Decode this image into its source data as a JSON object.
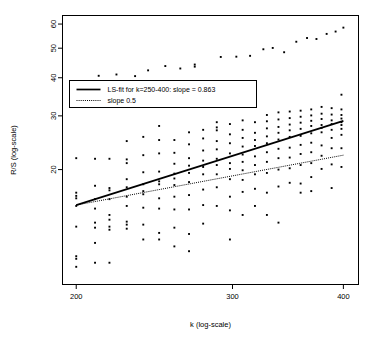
{
  "chart_data": {
    "type": "scatter",
    "title": "",
    "xlabel": "k (log-scale)",
    "ylabel": "R/S (log-scale)",
    "xscale": "log",
    "yscale": "log",
    "xlim": [
      193,
      416
    ],
    "ylim": [
      8.4,
      64
    ],
    "grid": false,
    "xticks": [
      200,
      300,
      400
    ],
    "xtick_labels": [
      "200",
      "300",
      "400"
    ],
    "yticks": [
      20,
      30,
      40,
      50,
      60
    ],
    "ytick_labels": [
      "20",
      "30",
      "40",
      "50",
      "60"
    ],
    "legend": {
      "position": "upper-left",
      "entries": [
        {
          "label": "LS-fit for k=250-400: slope = 0.863",
          "style": "solid"
        },
        {
          "label": "slope 0.5",
          "style": "dotted"
        }
      ]
    },
    "series": [
      {
        "name": "LS-fit for k=250-400: slope = 0.863",
        "type": "line",
        "style": "solid",
        "slope": 0.863,
        "x": [
          200,
          400
        ],
        "y": [
          15.3,
          28.9
        ]
      },
      {
        "name": "slope 0.5",
        "type": "line",
        "style": "dotted",
        "slope": 0.5,
        "x": [
          200,
          400
        ],
        "y": [
          15.3,
          22.3
        ]
      },
      {
        "name": "R/S values",
        "type": "scatter",
        "marker": "filled-square",
        "points": [
          [
            200,
            21.8
          ],
          [
            200,
            16.8
          ],
          [
            200,
            16.4
          ],
          [
            200,
            16.1
          ],
          [
            200,
            15.2
          ],
          [
            200,
            13.0
          ],
          [
            200,
            10.4
          ],
          [
            200,
            10.2
          ],
          [
            200,
            9.6
          ],
          [
            207,
            37.3
          ],
          [
            210,
            21.7
          ],
          [
            210,
            17.7
          ],
          [
            210,
            16.0
          ],
          [
            210,
            14.9
          ],
          [
            210,
            13.4
          ],
          [
            210,
            12.9
          ],
          [
            210,
            11.5
          ],
          [
            210,
            9.9
          ],
          [
            212,
            40.6
          ],
          [
            218,
            21.7
          ],
          [
            218,
            17.4
          ],
          [
            218,
            17.1
          ],
          [
            218,
            16.0
          ],
          [
            218,
            14.2
          ],
          [
            218,
            13.7
          ],
          [
            218,
            13.0
          ],
          [
            218,
            12.7
          ],
          [
            218,
            9.9
          ],
          [
            222,
            41.0
          ],
          [
            228,
            24.8
          ],
          [
            228,
            21.6
          ],
          [
            228,
            21.0
          ],
          [
            228,
            18.6
          ],
          [
            228,
            17.5
          ],
          [
            228,
            16.3
          ],
          [
            228,
            15.2
          ],
          [
            228,
            13.5
          ],
          [
            228,
            13.2
          ],
          [
            228,
            12.8
          ],
          [
            233,
            40.5
          ],
          [
            238,
            25.6
          ],
          [
            238,
            22.3
          ],
          [
            238,
            19.6
          ],
          [
            238,
            17.9
          ],
          [
            238,
            17.0
          ],
          [
            238,
            16.6
          ],
          [
            238,
            15.0
          ],
          [
            238,
            13.2
          ],
          [
            238,
            11.8
          ],
          [
            241,
            42.3
          ],
          [
            248,
            27.8
          ],
          [
            248,
            25.0
          ],
          [
            248,
            22.6
          ],
          [
            248,
            19.7
          ],
          [
            248,
            18.3
          ],
          [
            248,
            17.9
          ],
          [
            248,
            16.1
          ],
          [
            248,
            14.9
          ],
          [
            248,
            12.4
          ],
          [
            248,
            11.8
          ],
          [
            252,
            43.7
          ],
          [
            258,
            25.0
          ],
          [
            258,
            22.7
          ],
          [
            258,
            20.9
          ],
          [
            258,
            19.4
          ],
          [
            258,
            18.7
          ],
          [
            258,
            17.8
          ],
          [
            258,
            16.3
          ],
          [
            258,
            14.8
          ],
          [
            258,
            12.9
          ],
          [
            258,
            11.2
          ],
          [
            262,
            42.9
          ],
          [
            268,
            26.5
          ],
          [
            268,
            24.2
          ],
          [
            268,
            21.8
          ],
          [
            268,
            20.6
          ],
          [
            268,
            19.5
          ],
          [
            268,
            18.2
          ],
          [
            268,
            16.5
          ],
          [
            268,
            14.8
          ],
          [
            268,
            12.3
          ],
          [
            268,
            10.8
          ],
          [
            272,
            44.2
          ],
          [
            272,
            43.5
          ],
          [
            278,
            27.0
          ],
          [
            278,
            25.3
          ],
          [
            278,
            23.1
          ],
          [
            278,
            21.4
          ],
          [
            278,
            20.4
          ],
          [
            278,
            19.3
          ],
          [
            278,
            17.2
          ],
          [
            278,
            15.3
          ],
          [
            278,
            13.3
          ],
          [
            288,
            28.6
          ],
          [
            288,
            27.5
          ],
          [
            288,
            26.9
          ],
          [
            288,
            24.8
          ],
          [
            288,
            23.3
          ],
          [
            288,
            21.7
          ],
          [
            288,
            20.7
          ],
          [
            288,
            19.3
          ],
          [
            288,
            17.5
          ],
          [
            288,
            15.2
          ],
          [
            291,
            46.8
          ],
          [
            298,
            28.2
          ],
          [
            298,
            26.1
          ],
          [
            298,
            24.4
          ],
          [
            298,
            22.6
          ],
          [
            298,
            21.0
          ],
          [
            298,
            20.1
          ],
          [
            298,
            18.6
          ],
          [
            298,
            16.3
          ],
          [
            298,
            14.7
          ],
          [
            298,
            11.8
          ],
          [
            303,
            46.9
          ],
          [
            308,
            29.0
          ],
          [
            308,
            27.0
          ],
          [
            308,
            25.4
          ],
          [
            308,
            23.8
          ],
          [
            308,
            22.4
          ],
          [
            308,
            21.2
          ],
          [
            308,
            19.9
          ],
          [
            308,
            18.5
          ],
          [
            308,
            16.9
          ],
          [
            308,
            14.2
          ],
          [
            314,
            47.2
          ],
          [
            318,
            28.6
          ],
          [
            318,
            26.4
          ],
          [
            318,
            25.0
          ],
          [
            318,
            23.9
          ],
          [
            318,
            22.1
          ],
          [
            318,
            20.7
          ],
          [
            318,
            19.3
          ],
          [
            318,
            17.3
          ],
          [
            318,
            15.2
          ],
          [
            325,
            49.6
          ],
          [
            328,
            30.2
          ],
          [
            328,
            28.8
          ],
          [
            328,
            27.3
          ],
          [
            328,
            25.7
          ],
          [
            328,
            24.4
          ],
          [
            328,
            22.8
          ],
          [
            328,
            21.2
          ],
          [
            328,
            19.5
          ],
          [
            328,
            16.8
          ],
          [
            328,
            14.2
          ],
          [
            333,
            50.1
          ],
          [
            338,
            30.8
          ],
          [
            338,
            29.2
          ],
          [
            338,
            27.6
          ],
          [
            338,
            26.4
          ],
          [
            338,
            25.1
          ],
          [
            338,
            23.4
          ],
          [
            338,
            21.8
          ],
          [
            338,
            20.0
          ],
          [
            338,
            17.6
          ],
          [
            338,
            13.4
          ],
          [
            343,
            48.5
          ],
          [
            348,
            31.0
          ],
          [
            348,
            29.5
          ],
          [
            348,
            28.1
          ],
          [
            348,
            26.9
          ],
          [
            348,
            25.6
          ],
          [
            348,
            23.6
          ],
          [
            348,
            21.9
          ],
          [
            348,
            20.2
          ],
          [
            348,
            18.1
          ],
          [
            354,
            52.5
          ],
          [
            358,
            31.2
          ],
          [
            358,
            29.8
          ],
          [
            358,
            28.5
          ],
          [
            358,
            27.2
          ],
          [
            358,
            25.8
          ],
          [
            358,
            24.1
          ],
          [
            358,
            22.5
          ],
          [
            358,
            20.7
          ],
          [
            358,
            18.0
          ],
          [
            358,
            16.8
          ],
          [
            364,
            54.0
          ],
          [
            368,
            31.5
          ],
          [
            368,
            30.1
          ],
          [
            368,
            28.9
          ],
          [
            368,
            27.8
          ],
          [
            368,
            26.3
          ],
          [
            368,
            24.5
          ],
          [
            368,
            22.8
          ],
          [
            368,
            21.0
          ],
          [
            368,
            18.9
          ],
          [
            368,
            17.0
          ],
          [
            373,
            53.6
          ],
          [
            378,
            32.1
          ],
          [
            378,
            30.5
          ],
          [
            378,
            29.3
          ],
          [
            378,
            28.0
          ],
          [
            378,
            27.4
          ],
          [
            378,
            26.5
          ],
          [
            378,
            24.0
          ],
          [
            378,
            22.2
          ],
          [
            378,
            20.1
          ],
          [
            383,
            55.7
          ],
          [
            388,
            31.8
          ],
          [
            388,
            30.3
          ],
          [
            388,
            29.0
          ],
          [
            388,
            28.2
          ],
          [
            388,
            27.0
          ],
          [
            388,
            25.4
          ],
          [
            388,
            23.5
          ],
          [
            388,
            20.8
          ],
          [
            388,
            17.4
          ],
          [
            392,
            56.7
          ],
          [
            398,
            35.2
          ],
          [
            398,
            31.5
          ],
          [
            398,
            30.2
          ],
          [
            398,
            29.4
          ],
          [
            398,
            28.6
          ],
          [
            398,
            28.0
          ],
          [
            398,
            27.2
          ],
          [
            398,
            26.0
          ],
          [
            398,
            23.5
          ],
          [
            398,
            20.4
          ],
          [
            400,
            58.4
          ]
        ]
      }
    ]
  },
  "style": {
    "axis_color": "#000000",
    "point_color": "#000000",
    "fit_line_color": "#000000",
    "reference_line_color": "#000000",
    "background": "#ffffff"
  }
}
